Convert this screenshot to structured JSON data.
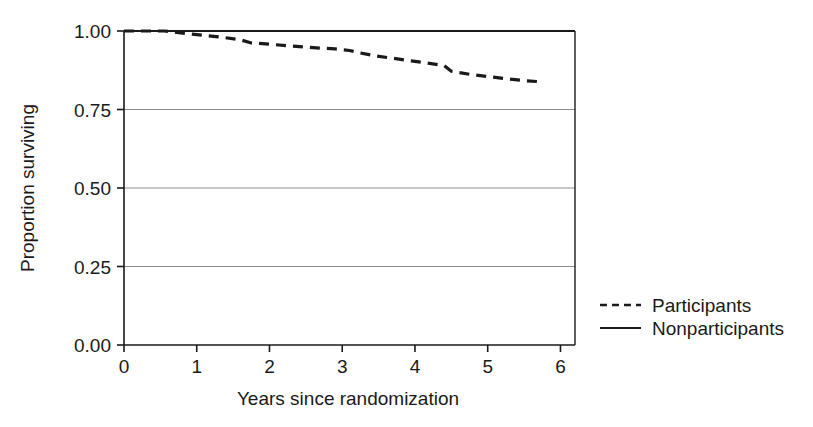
{
  "chart_data": {
    "type": "line",
    "title": "",
    "xlabel": "Years since randomization",
    "ylabel": "Proportion surviving",
    "xlim": [
      0,
      6.2
    ],
    "ylim": [
      0.0,
      1.0
    ],
    "xticks": [
      0,
      1,
      2,
      3,
      4,
      5,
      6
    ],
    "xtick_labels": [
      "0",
      "1",
      "2",
      "3",
      "4",
      "5",
      "6"
    ],
    "yticks": [
      0.0,
      0.25,
      0.5,
      0.75,
      1.0
    ],
    "ytick_labels": [
      "0.00",
      "0.25",
      "0.50",
      "0.75",
      "1.00"
    ],
    "grid": "horizontal",
    "legend_position": "right",
    "series": [
      {
        "name": "Participants",
        "style": "dashed",
        "color": "#1a1a1a",
        "points": [
          [
            0.0,
            1.0
          ],
          [
            0.55,
            1.0
          ],
          [
            0.7,
            0.996
          ],
          [
            0.9,
            0.991
          ],
          [
            1.1,
            0.986
          ],
          [
            1.35,
            0.98
          ],
          [
            1.6,
            0.972
          ],
          [
            1.75,
            0.962
          ],
          [
            2.0,
            0.958
          ],
          [
            2.3,
            0.952
          ],
          [
            2.6,
            0.947
          ],
          [
            2.9,
            0.943
          ],
          [
            3.1,
            0.938
          ],
          [
            3.25,
            0.93
          ],
          [
            3.45,
            0.921
          ],
          [
            3.7,
            0.913
          ],
          [
            3.95,
            0.905
          ],
          [
            4.2,
            0.897
          ],
          [
            4.4,
            0.89
          ],
          [
            4.5,
            0.872
          ],
          [
            4.75,
            0.862
          ],
          [
            5.0,
            0.855
          ],
          [
            5.25,
            0.848
          ],
          [
            5.5,
            0.842
          ],
          [
            5.75,
            0.838
          ]
        ]
      },
      {
        "name": "Nonparticipants",
        "style": "solid",
        "color": "#1a1a1a",
        "points": [
          [
            0.0,
            1.0
          ],
          [
            1.0,
            1.0
          ],
          [
            2.0,
            1.0
          ],
          [
            3.0,
            1.0
          ],
          [
            4.0,
            1.0
          ],
          [
            5.0,
            1.0
          ],
          [
            6.2,
            1.0
          ]
        ]
      }
    ],
    "legend_entries": [
      {
        "label": "Participants",
        "style": "dashed"
      },
      {
        "label": "Nonparticipants",
        "style": "solid"
      }
    ]
  },
  "axes": {
    "x_title": "Years since randomization",
    "y_title": "Proportion surviving"
  },
  "legend": {
    "participants_label": "Participants",
    "nonparticipants_label": "Nonparticipants"
  },
  "colors": {
    "axis": "#1a1a1a",
    "grid": "#8c8c8c",
    "line": "#1a1a1a",
    "background": "#ffffff"
  }
}
